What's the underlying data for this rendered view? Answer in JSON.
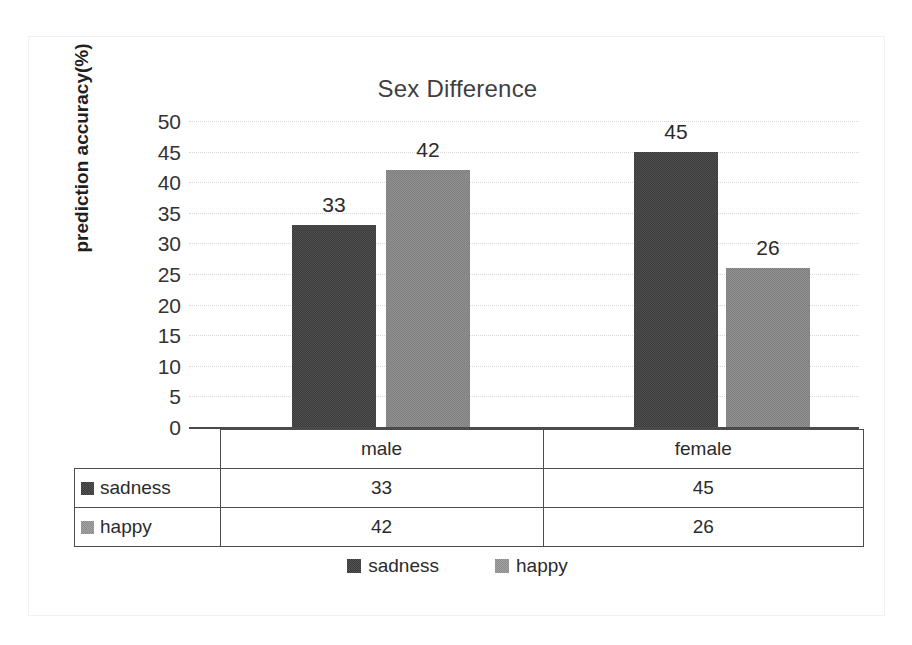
{
  "chart_data": {
    "type": "bar",
    "title": "Sex Difference",
    "xlabel": "",
    "ylabel": "prediction accuracy(%)",
    "categories": [
      "male",
      "female"
    ],
    "series": [
      {
        "name": "sadness",
        "values": [
          33,
          45
        ],
        "color": "#3b3b3b"
      },
      {
        "name": "happy",
        "values": [
          42,
          26
        ],
        "color": "#7d7d7d"
      }
    ],
    "ylim": [
      0,
      50
    ],
    "ytick_step": 5,
    "yticks": [
      "50",
      "45",
      "40",
      "35",
      "30",
      "25",
      "20",
      "15",
      "10",
      "5",
      "0"
    ],
    "grid": true,
    "legend_position": "bottom",
    "data_labels": [
      "33",
      "42",
      "45",
      "26"
    ],
    "data_table": {
      "visible": true,
      "column_headers": [
        "male",
        "female"
      ],
      "rows": [
        {
          "label": "sadness",
          "cells": [
            "33",
            "45"
          ]
        },
        {
          "label": "happy",
          "cells": [
            "42",
            "26"
          ]
        }
      ]
    }
  },
  "title": "Sex Difference",
  "axis": {
    "y_title": "prediction accuracy(%)",
    "ticks": [
      {
        "value": "50"
      },
      {
        "value": "45"
      },
      {
        "value": "40"
      },
      {
        "value": "35"
      },
      {
        "value": "30"
      },
      {
        "value": "25"
      },
      {
        "value": "20"
      },
      {
        "value": "15"
      },
      {
        "value": "10"
      },
      {
        "value": "5"
      },
      {
        "value": "0"
      }
    ]
  },
  "bars": [
    {
      "label": "33",
      "group": "male",
      "series": "sadness"
    },
    {
      "label": "42",
      "group": "male",
      "series": "happy"
    },
    {
      "label": "45",
      "group": "female",
      "series": "sadness"
    },
    {
      "label": "26",
      "group": "female",
      "series": "happy"
    }
  ],
  "table": {
    "header": {
      "male": "male",
      "female": "female"
    },
    "rows": [
      {
        "label": "sadness",
        "male": "33",
        "female": "45"
      },
      {
        "label": "happy",
        "male": "42",
        "female": "26"
      }
    ]
  },
  "legend": {
    "items": [
      {
        "label": "sadness"
      },
      {
        "label": "happy"
      }
    ]
  }
}
